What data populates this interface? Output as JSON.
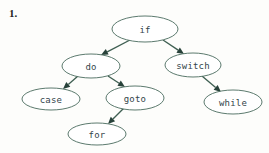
{
  "exercise": {
    "number_label": "1."
  },
  "colors": {
    "background": "#fdfdfb",
    "node_stroke": "#4a6b5d",
    "node_fill": "#ffffff",
    "node_text": "#33444a",
    "edge": "#3f5f52",
    "arrowhead": "#28423a",
    "number_text": "#1d1d1d"
  },
  "chart_data": {
    "type": "diagram",
    "diagram_kind": "directed-graph-tree",
    "title": "",
    "nodes": [
      {
        "id": "if",
        "label": "if",
        "cx": 145,
        "cy": 29,
        "rx": 33,
        "ry": 13
      },
      {
        "id": "do",
        "label": "do",
        "cx": 91,
        "cy": 66,
        "rx": 29,
        "ry": 12
      },
      {
        "id": "switch",
        "label": "switch",
        "cx": 193,
        "cy": 65,
        "rx": 28,
        "ry": 12
      },
      {
        "id": "case",
        "label": "case",
        "cx": 51,
        "cy": 99,
        "rx": 29,
        "ry": 11
      },
      {
        "id": "goto",
        "label": "goto",
        "cx": 135,
        "cy": 98,
        "rx": 29,
        "ry": 12
      },
      {
        "id": "while",
        "label": "while",
        "cx": 233,
        "cy": 102,
        "rx": 29,
        "ry": 12
      },
      {
        "id": "for",
        "label": "for",
        "cx": 97,
        "cy": 134,
        "rx": 29,
        "ry": 11
      }
    ],
    "edges": [
      {
        "from": "if",
        "to": "do",
        "x1": 130,
        "y1": 40,
        "x2": 101,
        "y2": 55
      },
      {
        "from": "if",
        "to": "switch",
        "x1": 163,
        "y1": 40,
        "x2": 184,
        "y2": 54
      },
      {
        "from": "do",
        "to": "case",
        "x1": 78,
        "y1": 76,
        "x2": 63,
        "y2": 89
      },
      {
        "from": "do",
        "to": "goto",
        "x1": 108,
        "y1": 76,
        "x2": 125,
        "y2": 87
      },
      {
        "from": "switch",
        "to": "while",
        "x1": 202,
        "y1": 76,
        "x2": 221,
        "y2": 92
      },
      {
        "from": "goto",
        "to": "for",
        "x1": 124,
        "y1": 108,
        "x2": 108,
        "y2": 124
      }
    ]
  }
}
